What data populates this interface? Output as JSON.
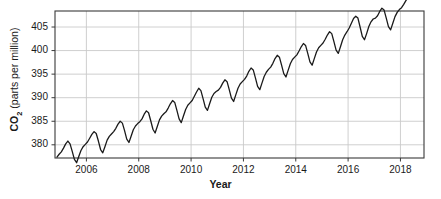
{
  "chart_data": {
    "type": "line",
    "title": "",
    "xlabel": "Year",
    "ylabel_prefix": "CO",
    "ylabel_sub": "2",
    "ylabel_unit": " (parts per million)",
    "ylabel_full": "CO2 (parts per million)",
    "xlim": [
      2004.8,
      2018.9
    ],
    "ylim": [
      377.2,
      408.4
    ],
    "grid": true,
    "legend": "none",
    "xticks": [
      2006,
      2008,
      2010,
      2012,
      2014,
      2016,
      2018
    ],
    "xtick_labels": [
      "2006",
      "2008",
      "2010",
      "2012",
      "2014",
      "2016",
      "2018"
    ],
    "yticks": [
      380,
      385,
      390,
      395,
      400,
      405
    ],
    "ytick_labels": [
      "380",
      "385",
      "390",
      "395",
      "400",
      "405"
    ],
    "line_color": "#1a1a1a",
    "line_width": 1.3,
    "grid_color": "#c9c9c9",
    "frame_color": "#3a3a3a",
    "background": "#ffffff",
    "series": [
      {
        "name": "Atmospheric CO2 monthly mean",
        "x": [
          2004.875,
          2004.958,
          2005.042,
          2005.125,
          2005.208,
          2005.292,
          2005.375,
          2005.458,
          2005.542,
          2005.625,
          2005.708,
          2005.792,
          2005.875,
          2005.958,
          2006.042,
          2006.125,
          2006.208,
          2006.292,
          2006.375,
          2006.458,
          2006.542,
          2006.625,
          2006.708,
          2006.792,
          2006.875,
          2006.958,
          2007.042,
          2007.125,
          2007.208,
          2007.292,
          2007.375,
          2007.458,
          2007.542,
          2007.625,
          2007.708,
          2007.792,
          2007.875,
          2007.958,
          2008.042,
          2008.125,
          2008.208,
          2008.292,
          2008.375,
          2008.458,
          2008.542,
          2008.625,
          2008.708,
          2008.792,
          2008.875,
          2008.958,
          2009.042,
          2009.125,
          2009.208,
          2009.292,
          2009.375,
          2009.458,
          2009.542,
          2009.625,
          2009.708,
          2009.792,
          2009.875,
          2009.958,
          2010.042,
          2010.125,
          2010.208,
          2010.292,
          2010.375,
          2010.458,
          2010.542,
          2010.625,
          2010.708,
          2010.792,
          2010.875,
          2010.958,
          2011.042,
          2011.125,
          2011.208,
          2011.292,
          2011.375,
          2011.458,
          2011.542,
          2011.625,
          2011.708,
          2011.792,
          2011.875,
          2011.958,
          2012.042,
          2012.125,
          2012.208,
          2012.292,
          2012.375,
          2012.458,
          2012.542,
          2012.625,
          2012.708,
          2012.792,
          2012.875,
          2012.958,
          2013.042,
          2013.125,
          2013.208,
          2013.292,
          2013.375,
          2013.458,
          2013.542,
          2013.625,
          2013.708,
          2013.792,
          2013.875,
          2013.958,
          2014.042,
          2014.125,
          2014.208,
          2014.292,
          2014.375,
          2014.458,
          2014.542,
          2014.625,
          2014.708,
          2014.792,
          2014.875,
          2014.958,
          2015.042,
          2015.125,
          2015.208,
          2015.292,
          2015.375,
          2015.458,
          2015.542,
          2015.625,
          2015.708,
          2015.792,
          2015.875,
          2015.958,
          2016.042,
          2016.125,
          2016.208,
          2016.292,
          2016.375,
          2016.458,
          2016.542,
          2016.625,
          2016.708,
          2016.792,
          2016.875,
          2016.958,
          2017.042,
          2017.125,
          2017.208,
          2017.292,
          2017.375,
          2017.458,
          2017.542,
          2017.625,
          2017.708,
          2017.792,
          2017.875,
          2017.958,
          2018.042,
          2018.125,
          2018.208,
          2018.292,
          2018.375
        ],
        "y": [
          377.4,
          378.0,
          378.5,
          379.3,
          380.2,
          380.8,
          380.2,
          378.6,
          376.9,
          376.2,
          377.5,
          378.8,
          379.6,
          380.1,
          380.6,
          381.4,
          382.2,
          382.8,
          382.4,
          380.8,
          379.0,
          378.3,
          379.6,
          381.0,
          381.8,
          382.3,
          382.8,
          383.5,
          384.4,
          385.0,
          384.6,
          383.0,
          381.2,
          380.5,
          381.8,
          383.2,
          384.0,
          384.5,
          384.9,
          385.5,
          386.5,
          387.2,
          386.8,
          385.1,
          383.3,
          382.5,
          383.9,
          385.3,
          386.1,
          386.6,
          387.0,
          387.8,
          388.7,
          389.4,
          389.0,
          387.3,
          385.5,
          384.7,
          386.1,
          387.5,
          388.4,
          388.9,
          389.4,
          390.3,
          391.2,
          392.0,
          391.5,
          389.8,
          388.0,
          387.3,
          388.7,
          390.1,
          390.9,
          391.3,
          391.6,
          392.2,
          393.1,
          393.8,
          393.4,
          391.7,
          389.9,
          389.2,
          390.6,
          392.0,
          392.9,
          393.4,
          393.9,
          394.6,
          395.6,
          396.3,
          395.9,
          394.2,
          392.4,
          391.7,
          393.1,
          394.5,
          395.4,
          396.0,
          396.5,
          397.3,
          398.3,
          399.0,
          398.6,
          396.9,
          395.1,
          394.4,
          395.8,
          397.2,
          398.1,
          398.6,
          399.1,
          399.9,
          400.8,
          401.5,
          401.1,
          399.4,
          397.6,
          396.9,
          398.3,
          399.7,
          400.6,
          401.1,
          401.6,
          402.4,
          403.3,
          404.0,
          403.6,
          401.9,
          400.1,
          399.4,
          400.8,
          402.3,
          403.3,
          404.0,
          404.8,
          405.8,
          406.8,
          407.3,
          406.9,
          405.0,
          403.0,
          402.3,
          403.6,
          405.1,
          406.1,
          406.7,
          406.9,
          407.4,
          408.3,
          409.0,
          408.6,
          406.9,
          405.1,
          404.4,
          405.8,
          407.2,
          408.1,
          408.7,
          409.1,
          409.8,
          410.6,
          411.3,
          411.0
        ]
      }
    ],
    "geometry": {
      "plot_left": 55,
      "plot_right": 424,
      "plot_top": 11,
      "plot_bottom": 158
    }
  }
}
